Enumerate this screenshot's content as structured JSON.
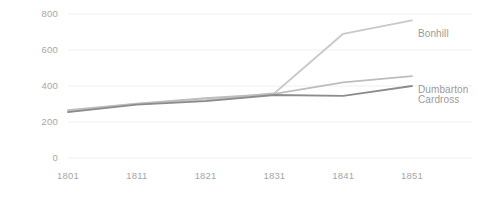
{
  "chart_data": {
    "type": "line",
    "title": "",
    "subtitle": "",
    "xlabel": "",
    "ylabel": "",
    "categories": [
      "1801",
      "1811",
      "1821",
      "1831",
      "1841",
      "1851"
    ],
    "x": [
      1801,
      1811,
      1821,
      1831,
      1841,
      1851
    ],
    "xlim": [
      1801,
      1851
    ],
    "ylim": [
      0,
      800
    ],
    "y_ticks": [
      "0",
      "200",
      "400",
      "600",
      "800"
    ],
    "y_tick_values": [
      0,
      200,
      400,
      600,
      800
    ],
    "x_ticks": [
      "1801",
      "1811",
      "1821",
      "1831",
      "1841",
      "1851"
    ],
    "grid": true,
    "grid_axis": "y",
    "legend": "line-end-labels",
    "legend_position": "right",
    "series": [
      {
        "name": "Bonhill",
        "color": "#c9c9c9",
        "values": [
          260,
          300,
          322,
          360,
          690,
          765
        ]
      },
      {
        "name": "Dumbarton",
        "color": "#bdbdbd",
        "values": [
          266,
          302,
          332,
          356,
          420,
          455
        ]
      },
      {
        "name": "Cardross",
        "color": "#8c8c8c",
        "values": [
          255,
          296,
          316,
          350,
          345,
          400
        ]
      }
    ]
  },
  "axes": {
    "tick_color": "#a6a6a6",
    "grid_color": "#efefef",
    "background": "#ffffff"
  },
  "series_labels": [
    {
      "text": "Bonhill"
    },
    {
      "text": "Dumbarton"
    },
    {
      "text": "Cardross"
    }
  ]
}
